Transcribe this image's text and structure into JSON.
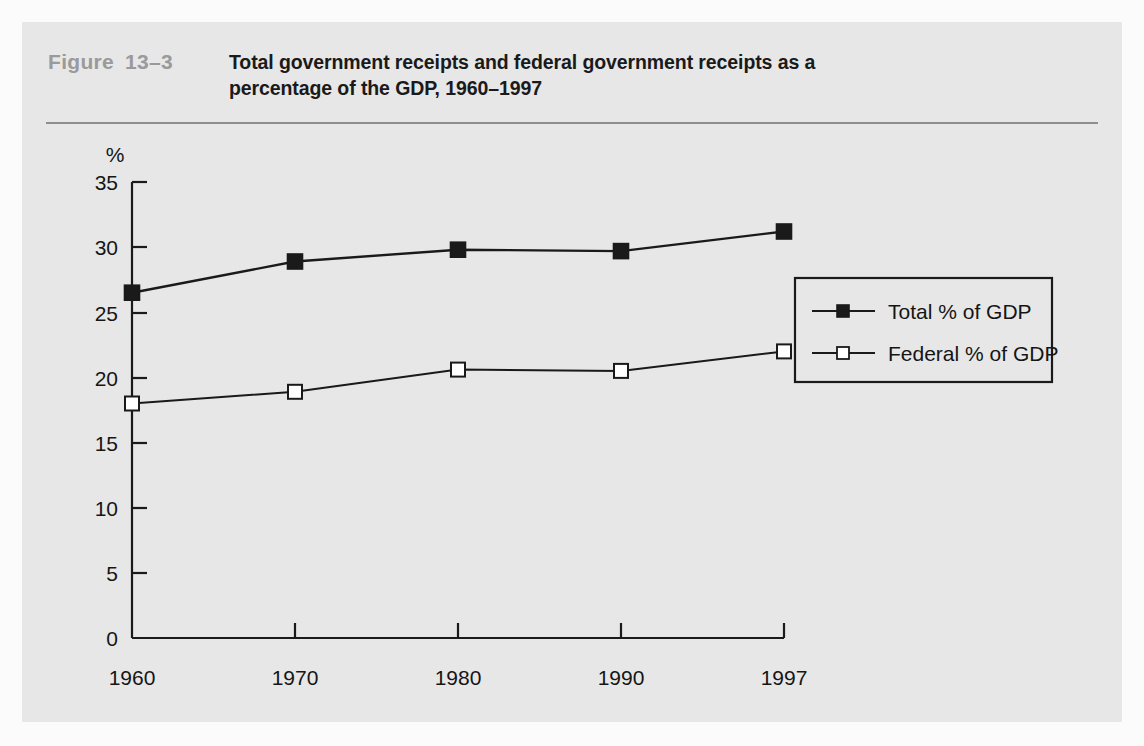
{
  "figure": {
    "label": "Figure",
    "number": "13–3",
    "title_line1": "Total government receipts and federal government receipts as a",
    "title_line2": "percentage of the GDP, 1960–1997"
  },
  "colors": {
    "panel_background": "#e7e7e7",
    "page_background": "#fbfbfb",
    "rule": "#8e8e8e",
    "figure_label": "#9a9a9a",
    "axis": "#1a1a1a",
    "series_total": "#1a1a1a",
    "series_federal": "#1a1a1a",
    "marker_federal_fill": "#ffffff"
  },
  "chart_data": {
    "type": "line",
    "title": "Total government receipts and federal government receipts as a percentage of the GDP, 1960–1997",
    "xlabel": "",
    "ylabel": "%",
    "categories": [
      "1960",
      "1970",
      "1980",
      "1990",
      "1997"
    ],
    "x": [
      1960,
      1970,
      1980,
      1990,
      1997
    ],
    "ylim": [
      0,
      35
    ],
    "yticks": [
      0,
      5,
      10,
      15,
      20,
      25,
      30,
      35
    ],
    "ytick_labels": [
      "0",
      "5",
      "10",
      "15",
      "20",
      "25",
      "30",
      "35"
    ],
    "xtick_labels": [
      "1960",
      "1970",
      "1980",
      "1990",
      "1997"
    ],
    "grid": false,
    "legend_position": "middle-right",
    "series": [
      {
        "name": "Total % of GDP",
        "marker": "filled-square",
        "values": [
          26.5,
          28.9,
          29.8,
          29.7,
          31.2
        ]
      },
      {
        "name": "Federal % of GDP",
        "marker": "open-square",
        "values": [
          18.0,
          18.9,
          20.6,
          20.5,
          22.0
        ]
      }
    ]
  },
  "legend": {
    "items": [
      {
        "label": "Total % of GDP",
        "marker": "filled-square"
      },
      {
        "label": "Federal % of GDP",
        "marker": "open-square"
      }
    ]
  },
  "axes": {
    "y_unit": "%",
    "y_labels": [
      "35",
      "30",
      "25",
      "20",
      "15",
      "10",
      "5",
      "0"
    ],
    "x_labels": [
      "1960",
      "1970",
      "1980",
      "1990",
      "1997"
    ]
  }
}
